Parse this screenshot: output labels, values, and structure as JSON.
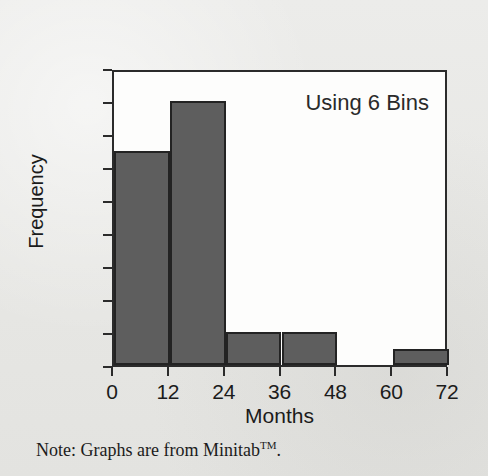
{
  "figure": {
    "annotation": "Using 6 Bins",
    "footnote_prefix": "Note: Graphs are from Minitab",
    "footnote_superscript": "TM",
    "footnote_suffix": ".",
    "bar_color": "#5e5e5e",
    "bar_border_color": "#232323",
    "axis_color": "#2b2b2b",
    "plot_background": "#fdfdfc",
    "page_background": "#eaeae7"
  },
  "chart_data": {
    "type": "bar",
    "title": "",
    "subtitle": "",
    "annotations": [
      "Using 6 Bins"
    ],
    "xlabel": "Months",
    "ylabel": "Frequency",
    "xlim": [
      0,
      72
    ],
    "ylim": [
      0,
      18
    ],
    "xticks": [
      0,
      12,
      24,
      36,
      48,
      60,
      72
    ],
    "yticks": [
      0,
      2,
      4,
      6,
      8,
      10,
      12,
      14,
      16,
      18
    ],
    "xtick_labels": [
      "0",
      "12",
      "24",
      "36",
      "48",
      "60",
      "72"
    ],
    "ytick_labels": [
      "0",
      "2",
      "4",
      "6",
      "8",
      "10",
      "12",
      "14",
      "16",
      "18"
    ],
    "grid": false,
    "legend": false,
    "bin_width": 12,
    "bin_count": 6,
    "bin_edges": [
      0,
      12,
      24,
      36,
      48,
      60,
      72
    ],
    "categories": [
      "0-12",
      "12-24",
      "24-36",
      "36-48",
      "48-60",
      "60-72"
    ],
    "values": [
      13,
      16,
      2,
      2,
      0,
      1
    ],
    "bins": [
      {
        "start": 0,
        "end": 12,
        "frequency": 13
      },
      {
        "start": 12,
        "end": 24,
        "frequency": 16
      },
      {
        "start": 24,
        "end": 36,
        "frequency": 2
      },
      {
        "start": 36,
        "end": 48,
        "frequency": 2
      },
      {
        "start": 48,
        "end": 60,
        "frequency": 0
      },
      {
        "start": 60,
        "end": 72,
        "frequency": 1
      }
    ]
  }
}
